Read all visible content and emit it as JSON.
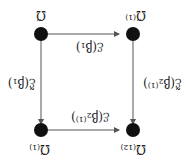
{
  "diagram": {
    "type": "commutative-square",
    "orientation": "rotated-180",
    "nodes": {
      "top_left": "Ω̃₍₁₂₎",
      "top_right": "Ω̃₍₁₎",
      "bottom_left": "Ω̃⁽¹⁾",
      "bottom_right": "Ω̃"
    },
    "arrows": {
      "top": "ℰ(β₂⁽¹⁾)",
      "bottom": "ℰ(β₁)",
      "left": "ℰ̃(β₂⁽¹⁾)",
      "right": "ℰ̃(β₁)"
    },
    "colors": {
      "node": "#111111",
      "edge": "#555555"
    }
  }
}
